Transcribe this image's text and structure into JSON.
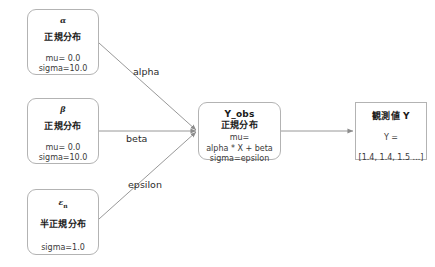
{
  "diagram": {
    "type": "probabilistic-graphical-model",
    "nodes": [
      {
        "id": "alpha",
        "symbol": "α",
        "subscript": "",
        "distribution": "正規分布",
        "params": [
          "mu= 0.0",
          "sigma=10.0"
        ],
        "shape": "rounded-rectangle"
      },
      {
        "id": "beta",
        "symbol": "β",
        "subscript": "",
        "distribution": "正規分布",
        "params": [
          "mu= 0.0",
          "sigma=10.0"
        ],
        "shape": "rounded-rectangle"
      },
      {
        "id": "epsilon",
        "symbol": "ε",
        "subscript": "n",
        "distribution": "半正規分布",
        "params": [
          "sigma=1.0"
        ],
        "shape": "rounded-rectangle"
      },
      {
        "id": "y_obs",
        "title": "Y_obs",
        "distribution": "正規分布",
        "params": [
          "mu=",
          "alpha * X + beta",
          "sigma=epsilon"
        ],
        "shape": "rounded-rectangle"
      },
      {
        "id": "observed_y",
        "title": "観測値 Y",
        "assignment": "Y =",
        "values": "[1.4, 1.4, 1.5 ...]",
        "shape": "rectangle"
      }
    ],
    "edges": [
      {
        "id": "edge-alpha",
        "from": "alpha",
        "to": "y_obs",
        "label": "alpha"
      },
      {
        "id": "edge-beta",
        "from": "beta",
        "to": "y_obs",
        "label": "beta"
      },
      {
        "id": "edge-epsilon",
        "from": "epsilon",
        "to": "y_obs",
        "label": "epsilon"
      },
      {
        "id": "edge-output",
        "from": "y_obs",
        "to": "observed_y",
        "label": ""
      }
    ],
    "colors": {
      "background": "#ffffff",
      "node_border": "#b3b3b3",
      "node_fill": "#ffffff",
      "edge": "#8c8c8c",
      "text": "#1a1a1a",
      "param_text": "#3a3a3a"
    }
  }
}
